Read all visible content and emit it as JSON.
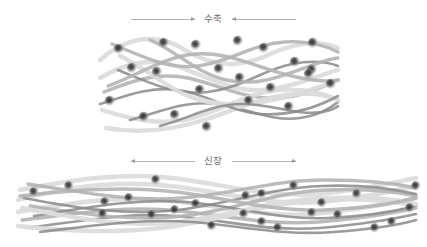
{
  "figure": {
    "background_color": "#ffffff"
  },
  "panels": [
    {
      "id": "contracted",
      "label": "수축",
      "arrow_direction": "inward",
      "arrow_left_label": "arrow-right-icon",
      "arrow_right_label": "arrow-left-icon"
    },
    {
      "id": "stretched",
      "label": "신장",
      "arrow_direction": "outward",
      "arrow_left_label": "arrow-left-icon",
      "arrow_right_label": "arrow-right-icon"
    }
  ],
  "colors": {
    "fiber_light": "#dcdcdc",
    "fiber_mid": "#b4b4b4",
    "fiber_dark": "#8a8a8a",
    "node_core": "#343434",
    "arrow_line": "#b0b0b0",
    "arrow_head": "#9a9a9a",
    "label_text": "#6e6e6e",
    "background": "#ffffff"
  },
  "chart_data": {
    "type": "diagram",
    "annotations": [
      "수축",
      "신장"
    ],
    "contracted": {
      "label": "수축",
      "x_extent": [
        100,
        338
      ],
      "y_extent": [
        28,
        134
      ],
      "node_count": 22,
      "fiber_count": 13,
      "nodes": [
        [
          119,
          49
        ],
        [
          164,
          43
        ],
        [
          196,
          45
        ],
        [
          238,
          41
        ],
        [
          264,
          48
        ],
        [
          313,
          43
        ],
        [
          132,
          68
        ],
        [
          157,
          72
        ],
        [
          219,
          69
        ],
        [
          312,
          70
        ],
        [
          295,
          62
        ],
        [
          110,
          101
        ],
        [
          144,
          117
        ],
        [
          175,
          115
        ],
        [
          200,
          90
        ],
        [
          240,
          78
        ],
        [
          271,
          88
        ],
        [
          309,
          74
        ],
        [
          249,
          101
        ],
        [
          289,
          107
        ],
        [
          331,
          84
        ],
        [
          207,
          127
        ]
      ],
      "fibers": [
        {
          "tone": "light",
          "path": "M 100 60 C 130 34, 160 34, 185 50 C 212 67, 240 68, 268 55 C 296 42, 320 40, 338 48"
        },
        {
          "tone": "light",
          "path": "M 100 78 C 128 62, 150 58, 176 66 C 206 76, 232 92, 262 90 C 292 88, 316 76, 338 70"
        },
        {
          "tone": "mid",
          "path": "M 104 92 C 134 80, 158 72, 188 78 C 220 85, 246 100, 278 98 C 306 96, 324 86, 338 80"
        },
        {
          "tone": "dark",
          "path": "M 118 70 C 148 82, 176 96, 208 92 C 242 88, 262 70, 292 64 C 312 60, 328 62, 338 66"
        },
        {
          "tone": "light",
          "path": "M 102 110 C 134 120, 162 126, 192 118 C 224 110, 248 92, 280 90 C 308 88, 326 94, 338 100"
        },
        {
          "tone": "mid",
          "path": "M 112 44 C 142 56, 168 70, 198 66 C 230 62, 252 44, 284 42 C 310 40, 326 46, 338 52"
        },
        {
          "tone": "dark",
          "path": "M 130 120 C 160 112, 186 100, 216 104 C 248 108, 270 122, 300 118 C 320 115, 330 108, 338 102"
        },
        {
          "tone": "light",
          "path": "M 106 128 C 140 134, 172 130, 204 120 C 238 109, 262 96, 296 94 C 318 93, 330 96, 338 100"
        },
        {
          "tone": "mid",
          "path": "M 150 40 C 178 52, 198 74, 226 80 C 258 87, 282 76, 310 66 C 324 61, 332 58, 338 58"
        },
        {
          "tone": "dark",
          "path": "M 100 104 C 126 96, 150 86, 178 90 C 208 94, 230 112, 260 114 C 290 116, 316 108, 338 96"
        },
        {
          "tone": "light",
          "path": "M 120 56 C 150 70, 170 92, 200 100 C 232 108, 258 104, 288 96 C 312 90, 328 84, 338 80"
        },
        {
          "tone": "mid",
          "path": "M 108 86 C 140 74, 166 56, 196 54 C 228 52, 254 66, 284 74 C 310 81, 328 82, 338 80"
        },
        {
          "tone": "dark",
          "path": "M 160 126 C 190 118, 212 104, 242 104 C 274 104, 296 116, 322 112 C 332 110, 336 108, 338 106"
        }
      ]
    },
    "stretched": {
      "label": "신장",
      "x_extent": [
        18,
        416
      ],
      "y_extent": [
        172,
        242
      ],
      "node_count": 24,
      "fiber_count": 13,
      "nodes": [
        [
          34,
          192
        ],
        [
          69,
          186
        ],
        [
          105,
          202
        ],
        [
          156,
          180
        ],
        [
          175,
          210
        ],
        [
          103,
          214
        ],
        [
          196,
          204
        ],
        [
          246,
          196
        ],
        [
          262,
          194
        ],
        [
          244,
          214
        ],
        [
          262,
          222
        ],
        [
          212,
          226
        ],
        [
          152,
          215
        ],
        [
          294,
          186
        ],
        [
          322,
          203
        ],
        [
          312,
          213
        ],
        [
          357,
          194
        ],
        [
          338,
          215
        ],
        [
          375,
          228
        ],
        [
          392,
          222
        ],
        [
          410,
          208
        ],
        [
          416,
          186
        ],
        [
          129,
          198
        ],
        [
          278,
          228
        ]
      ],
      "fibers": [
        {
          "tone": "light",
          "path": "M 18 200 C 70 186, 120 180, 170 186 C 224 192, 268 206, 320 202 C 366 198, 396 190, 416 186"
        },
        {
          "tone": "light",
          "path": "M 18 212 C 66 204, 112 196, 162 200 C 216 205, 262 218, 314 214 C 362 210, 396 202, 416 198"
        },
        {
          "tone": "mid",
          "path": "M 22 220 C 74 214, 118 206, 168 210 C 220 214, 266 226, 318 222 C 364 218, 398 212, 416 208"
        },
        {
          "tone": "dark",
          "path": "M 26 228 C 78 222, 124 212, 174 216 C 226 220, 268 232, 320 228 C 364 224, 398 218, 416 214"
        },
        {
          "tone": "light",
          "path": "M 20 190 C 72 180, 122 172, 172 178 C 224 184, 266 198, 318 194 C 364 190, 396 182, 416 178"
        },
        {
          "tone": "mid",
          "path": "M 30 206 C 84 214, 132 222, 184 216 C 236 210, 274 192, 326 190 C 368 188, 398 192, 416 196"
        },
        {
          "tone": "dark",
          "path": "M 24 198 C 76 208, 126 216, 178 210 C 230 204, 270 188, 322 186 C 366 184, 398 190, 416 194"
        },
        {
          "tone": "light",
          "path": "M 18 226 C 72 232, 124 234, 176 226 C 228 218, 270 202, 322 200 C 366 198, 398 202, 416 206"
        },
        {
          "tone": "mid",
          "path": "M 28 184 C 80 192, 130 202, 182 198 C 234 194, 272 180, 324 180 C 368 180, 398 184, 416 188"
        },
        {
          "tone": "dark",
          "path": "M 34 216 C 86 208, 134 198, 186 202 C 238 206, 276 220, 328 218 C 370 216, 400 210, 416 206"
        },
        {
          "tone": "light",
          "path": "M 22 208 C 76 218, 126 228, 178 222 C 230 216, 272 200, 324 198 C 368 196, 400 200, 416 204"
        },
        {
          "tone": "mid",
          "path": "M 20 196 C 74 190, 124 186, 176 192 C 228 198, 272 212, 324 210 C 368 208, 400 202, 416 198"
        },
        {
          "tone": "dark",
          "path": "M 40 232 C 92 226, 140 218, 192 222 C 244 226, 282 236, 334 232 C 374 229, 402 224, 416 220"
        }
      ]
    }
  }
}
